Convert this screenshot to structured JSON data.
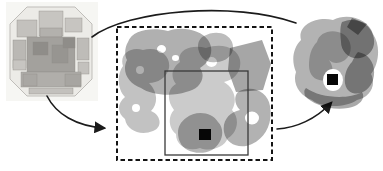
{
  "figure": {
    "width": 383,
    "height": 171,
    "background": "#ffffff"
  },
  "colors": {
    "stroke": "#1b1b1b",
    "box_dashed": "#141414",
    "box_solid": "#3a3a3a",
    "marker": "#060606",
    "halo": "#ffffff"
  },
  "chip": {
    "name": "chip-die-photo",
    "photo_bg": {
      "x": 6,
      "y": 2,
      "w": 92,
      "h": 99,
      "fill": "#f6f6f3"
    },
    "octagon": {
      "points": "27,7 75,7 92,24 92,79 75,96 27,96 10,79 10,24",
      "fill": "#ecebe7",
      "stroke": "#bfbdb9"
    },
    "blocks": [
      {
        "x": 39,
        "y": 11,
        "w": 24,
        "h": 25,
        "fill": "#c7c5c1"
      },
      {
        "x": 17,
        "y": 20,
        "w": 20,
        "h": 17,
        "fill": "#c3c1bd"
      },
      {
        "x": 65,
        "y": 18,
        "w": 17,
        "h": 14,
        "fill": "#c7c5c1"
      },
      {
        "x": 40,
        "y": 28,
        "w": 22,
        "h": 9,
        "fill": "#b3b1ad"
      },
      {
        "x": 13,
        "y": 40,
        "w": 13,
        "h": 28,
        "fill": "#bab8b4"
      },
      {
        "x": 77,
        "y": 38,
        "w": 12,
        "h": 22,
        "fill": "#bebcb8"
      },
      {
        "x": 27,
        "y": 37,
        "w": 48,
        "h": 35,
        "fill": "#a3a19d"
      },
      {
        "x": 33,
        "y": 42,
        "w": 15,
        "h": 13,
        "fill": "#8f8d89"
      },
      {
        "x": 52,
        "y": 45,
        "w": 16,
        "h": 18,
        "fill": "#979591"
      },
      {
        "x": 63,
        "y": 38,
        "w": 12,
        "h": 10,
        "fill": "#8f8d89"
      },
      {
        "x": 13,
        "y": 60,
        "w": 13,
        "h": 10,
        "fill": "#c7c5c1"
      },
      {
        "x": 78,
        "y": 62,
        "w": 11,
        "h": 12,
        "fill": "#c3c1bd"
      },
      {
        "x": 21,
        "y": 72,
        "w": 60,
        "h": 15,
        "fill": "#b0aeaa"
      },
      {
        "x": 23,
        "y": 74,
        "w": 14,
        "h": 12,
        "fill": "#a9a7a3"
      },
      {
        "x": 65,
        "y": 74,
        "w": 16,
        "h": 12,
        "fill": "#a7a5a1"
      },
      {
        "x": 29,
        "y": 88,
        "w": 44,
        "h": 6,
        "fill": "#c3c1bd"
      }
    ]
  },
  "region": {
    "name": "zoomed-layout-region",
    "dashed_box": {
      "x": 117,
      "y": 27,
      "w": 155,
      "h": 133
    },
    "solid_box": {
      "x": 165,
      "y": 71,
      "w": 83,
      "h": 84
    },
    "marker": {
      "x": 199,
      "y": 129,
      "w": 12,
      "h": 11
    },
    "blobs": [
      {
        "name": "freeform-shape",
        "fill": "#b0b0b0",
        "d": "M128,42 C132,30 152,27 168,31 C182,26 201,30 208,40 C215,50 210,62 200,68 C207,78 199,90 186,92 C172,97 151,95 141,88 C129,84 121,72 127,60 C124,54 125,47 128,42 Z M157,49 a4.5,4 0 1,0 9,0 a4.5,4 0 1,0 -9,0 Z M172,58 a3.5,3 0 1,0 7,0 a3.5,3 0 1,0 -7,0 Z"
      },
      {
        "name": "freeform-shape",
        "fill": "#c2c2c2",
        "d": "M123,66 C119,54 131,46 143,50 C159,46 171,56 169,68 C167,78 157,83 149,83 C157,91 159,103 151,111 C161,115 163,127 153,131 C141,136 127,131 125,119 C117,113 117,103 125,97 C117,89 117,74 123,66 Z M136,70 a4,4 0 1,0 8,0 a4,4 0 1,0 -8,0 Z M132,108 a4,4 0 1,0 8,0 a4,4 0 1,0 -8,0 Z"
      },
      {
        "name": "freeform-shape",
        "fill": "#bcbcbc",
        "d": "M204,36 C214,30 228,32 232,42 C236,52 228,62 216,62 C206,64 198,56 198,46 C198,42 200,38 204,36 Z"
      },
      {
        "name": "freeform-shape",
        "fill": "#a6a6a6",
        "d": "M230,48 L262,40 L271,64 L263,90 L236,92 L228,70 Z"
      },
      {
        "name": "freeform-shape",
        "fill": "#cbcbcb",
        "d": "M180,62 C176,50 192,44 206,48 C222,42 238,48 240,60 C242,72 234,80 224,82 C234,88 238,100 232,110 C240,118 238,132 228,138 C224,148 210,152 200,148 C188,152 176,146 176,134 C168,128 168,116 174,110 C166,100 168,88 176,84 C170,76 172,68 180,62 Z M206,62 a5.5,5 0 1,0 11,0 a5.5,5 0 1,0 -11,0 Z"
      },
      {
        "name": "freeform-shape",
        "fill": "#b2b2b2",
        "d": "M238,92 C252,84 268,92 270,106 C273,122 266,138 252,144 C240,150 226,144 224,132 C222,120 230,112 240,110 C234,104 234,96 238,92 Z M245,118 a7,6.5 0 1,0 14,0 a7,6.5 0 1,0 -14,0 Z"
      },
      {
        "name": "freeform-shape",
        "fill": "#b6b6b6",
        "d": "M186,118 C196,110 212,112 218,122 C226,130 222,144 212,150 C200,156 184,152 180,142 C176,132 178,124 186,118 Z"
      }
    ]
  },
  "cell": {
    "name": "zoomed-cell-view",
    "halo": {
      "cx": 333,
      "cy": 80,
      "rx": 10,
      "ry": 11
    },
    "marker": {
      "x": 327,
      "y": 74,
      "w": 11,
      "h": 11
    },
    "blobs": [
      {
        "name": "cell-blob",
        "fill": "#b3b3b3",
        "d": "M301,40 C297,26 315,16 333,20 C349,12 369,20 373,34 C381,46 379,64 371,74 C377,86 369,98 357,100 C345,108 322,108 312,100 C300,96 292,84 296,72 C291,60 293,48 301,40 Z"
      },
      {
        "name": "cell-blob",
        "fill": "#a2a2a2",
        "d": "M342,22 C356,16 370,24 373,35 C377,47 370,56 360,58 C350,60 341,52 341,42 C340,34 340,26 342,22 Z"
      },
      {
        "name": "cell-blob",
        "fill": "#9b9b9b",
        "d": "M352,18 L367,24 L358,35 L347,27 Z"
      },
      {
        "name": "cell-blob",
        "fill": "#a6a6a6",
        "d": "M358,52 C370,54 377,66 373,80 C369,92 357,97 349,91 C342,85 344,70 352,62 C354,58 356,54 358,52 Z"
      },
      {
        "name": "cell-blob",
        "fill": "#c8c8c8",
        "d": "M317,42 C319,32 333,28 343,34 C353,40 353,54 345,60 C339,64 333,64 329,60 C335,68 333,78 325,80 C317,82 309,76 309,66 C309,56 311,48 317,42 Z"
      },
      {
        "name": "cell-blob",
        "fill": "#a9a9a9",
        "d": "M306,88 C320,98 348,100 362,92 C366,98 360,106 348,108 C330,111 312,104 305,96 C304,92 304,90 306,88 Z"
      }
    ]
  },
  "arrows": [
    {
      "name": "chip-to-region-arrow",
      "d": "M47,96 C56,114 76,126 104,128",
      "head": true
    },
    {
      "name": "region-to-cell-arrow",
      "d": "M277,129 C296,128 316,119 331,103",
      "head": true
    },
    {
      "name": "top-connector-arc",
      "d": "M92,37 C128,10 235,1 296,23",
      "head": false
    }
  ]
}
